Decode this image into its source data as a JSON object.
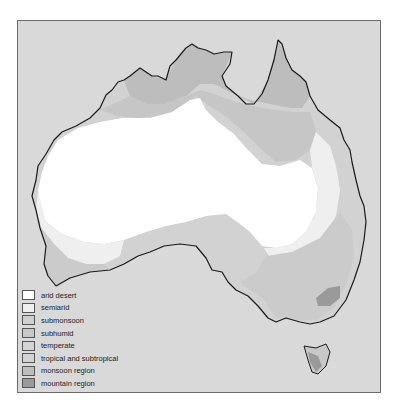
{
  "map": {
    "subject": "Climate regions of Australia",
    "colors": {
      "sea": "#d9d9d9",
      "arid_desert": "#ffffff",
      "semiarid": "#efefef",
      "submonsoon": "#cfcfcf",
      "subhumid": "#c8c8c8",
      "temperate": "#d4d4d4",
      "tropical_subtropical": "#d2d2d2",
      "monsoon_region": "#bdbdbd",
      "mountain_region": "#9a9a9a",
      "coastline": "#1a1a1a"
    }
  },
  "legend": {
    "items": [
      {
        "label": "arid desert",
        "color": "#ffffff"
      },
      {
        "label": "semiarid",
        "color": "#efefef"
      },
      {
        "label": "submonsoon",
        "color": "#cfcfcf"
      },
      {
        "label": "subhumid",
        "color": "#c8c8c8"
      },
      {
        "label": "temperate",
        "color": "#d4d4d4"
      },
      {
        "label": "tropical and subtropical",
        "color": "#d2d2d2"
      },
      {
        "label": "monsoon region",
        "color": "#bdbdbd"
      },
      {
        "label": "mountain region",
        "color": "#9a9a9a"
      }
    ]
  }
}
